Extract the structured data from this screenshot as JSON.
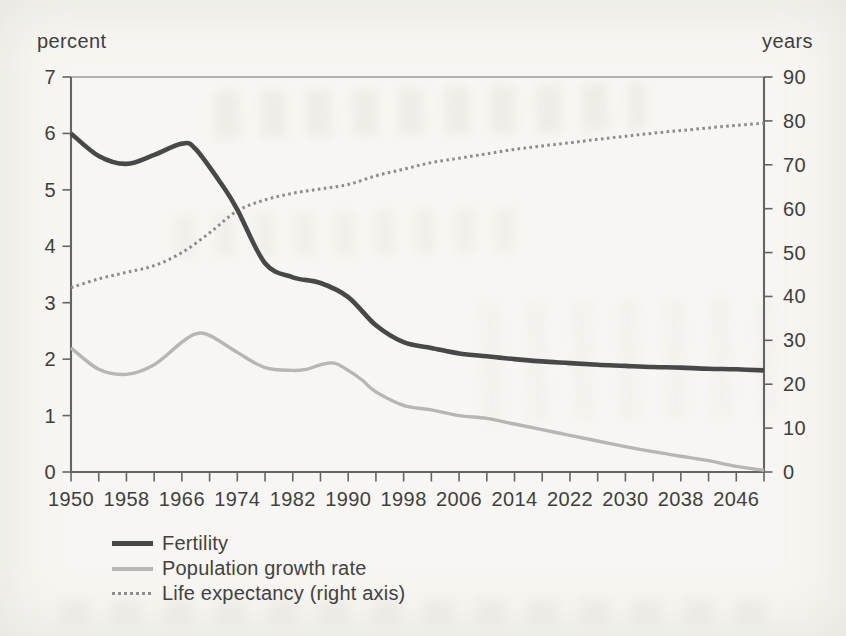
{
  "page": {
    "background": "#f7f6f2",
    "text_color": "#3f3f3f"
  },
  "chart": {
    "axis_color": "#646464",
    "top_border_color": "#9b9b9b"
  },
  "chart_data": {
    "type": "line",
    "title": "",
    "left_axis": {
      "label": "percent",
      "range": [
        0,
        7
      ],
      "ticks": [
        0,
        1,
        2,
        3,
        4,
        5,
        6,
        7
      ]
    },
    "right_axis": {
      "label": "years",
      "range": [
        0,
        90
      ],
      "ticks": [
        0,
        10,
        20,
        30,
        40,
        50,
        60,
        70,
        80,
        90
      ]
    },
    "x_axis": {
      "range": [
        1950,
        2050
      ],
      "minor_tick_step": 4,
      "label_step": 8,
      "tick_labels": [
        "1950",
        "1958",
        "1966",
        "1974",
        "1982",
        "1990",
        "1998",
        "2006",
        "2014",
        "2022",
        "2030",
        "2038",
        "2046"
      ]
    },
    "legend_position": "bottom-left",
    "grid": false,
    "series": [
      {
        "name": "Fertility",
        "slug": "fertility",
        "axis": "left",
        "swatch": "solid-thick",
        "color": "#484848",
        "stroke_width": 4.6,
        "x": [
          1950,
          1954,
          1958,
          1962,
          1966,
          1968,
          1972,
          1974,
          1978,
          1982,
          1986,
          1990,
          1994,
          1998,
          2002,
          2006,
          2010,
          2014,
          2018,
          2022,
          2026,
          2030,
          2034,
          2038,
          2042,
          2046,
          2050
        ],
        "y": [
          6.0,
          5.6,
          5.46,
          5.62,
          5.82,
          5.72,
          5.05,
          4.65,
          3.7,
          3.45,
          3.35,
          3.1,
          2.6,
          2.3,
          2.2,
          2.1,
          2.05,
          2.0,
          1.96,
          1.93,
          1.9,
          1.88,
          1.86,
          1.85,
          1.83,
          1.82,
          1.8
        ]
      },
      {
        "name": "Population growth rate",
        "slug": "population-growth-rate",
        "axis": "left",
        "swatch": "solid-light",
        "color": "#b7b6b3",
        "stroke_width": 3.4,
        "x": [
          1950,
          1954,
          1958,
          1962,
          1966,
          1968,
          1970,
          1974,
          1978,
          1982,
          1984,
          1986,
          1988,
          1990,
          1992,
          1994,
          1998,
          2002,
          2006,
          2010,
          2014,
          2018,
          2022,
          2026,
          2030,
          2034,
          2038,
          2042,
          2046,
          2050
        ],
        "y": [
          2.2,
          1.82,
          1.73,
          1.9,
          2.3,
          2.45,
          2.42,
          2.12,
          1.85,
          1.8,
          1.82,
          1.9,
          1.93,
          1.8,
          1.63,
          1.42,
          1.18,
          1.1,
          1.0,
          0.95,
          0.85,
          0.75,
          0.65,
          0.55,
          0.45,
          0.36,
          0.28,
          0.2,
          0.1,
          0.03
        ]
      },
      {
        "name": "Life expectancy (right axis)",
        "slug": "life-expectancy",
        "axis": "right",
        "swatch": "dotted",
        "color": "#8c8c8c",
        "stroke_width": 3,
        "x": [
          1950,
          1954,
          1958,
          1962,
          1966,
          1970,
          1974,
          1978,
          1982,
          1986,
          1990,
          1994,
          1998,
          2002,
          2006,
          2010,
          2014,
          2018,
          2022,
          2026,
          2030,
          2034,
          2038,
          2042,
          2046,
          2050
        ],
        "y": [
          42,
          44,
          45.5,
          47,
          50,
          54.5,
          59.5,
          62,
          63.5,
          64.5,
          65.5,
          67.5,
          69,
          70.5,
          71.5,
          72.5,
          73.5,
          74.3,
          75,
          75.8,
          76.5,
          77.2,
          77.8,
          78.4,
          79,
          79.5
        ]
      }
    ]
  }
}
